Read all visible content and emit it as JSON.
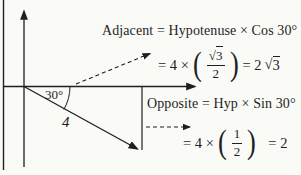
{
  "canvas": {
    "background": "#fafaf7",
    "ink": "#1f1f1f"
  },
  "adjacent": {
    "heading": "Adjacent = Hypotenuse × Cos 30°",
    "step_prefix": "= 4 ×",
    "fraction": {
      "numerator_radical": "√",
      "numerator_arg": "3",
      "denominator": "2"
    },
    "result_prefix": "= 2",
    "result_radical": "√",
    "result_arg": "3"
  },
  "opposite": {
    "heading": "Opposite = Hyp × Sin 30°",
    "step_prefix": "= 4 ×",
    "fraction": {
      "numerator": "1",
      "denominator": "2"
    },
    "result": "= 2"
  },
  "diagram": {
    "angle_label": "30°",
    "hypotenuse_label": "4"
  },
  "glyphs": {
    "open_paren": "(",
    "close_paren": ")"
  }
}
